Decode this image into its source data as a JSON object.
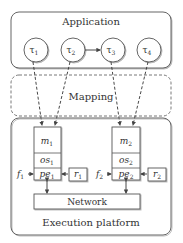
{
  "application": {
    "title": "Application",
    "tasks": [
      {
        "label": "τ",
        "sub": "1"
      },
      {
        "label": "τ",
        "sub": "2"
      },
      {
        "label": "τ",
        "sub": "3"
      },
      {
        "label": "τ",
        "sub": "4"
      }
    ]
  },
  "mapping": {
    "title": "Mapping"
  },
  "platform": {
    "title": "Execution platform",
    "nodes": [
      {
        "m": {
          "label": "m",
          "sub": "1"
        },
        "os": {
          "label": "os",
          "sub": "1"
        },
        "pe": {
          "label": "pe",
          "sub": "1"
        },
        "f": {
          "label": "f",
          "sub": "1"
        },
        "r": {
          "label": "r",
          "sub": "1"
        }
      },
      {
        "m": {
          "label": "m",
          "sub": "2"
        },
        "os": {
          "label": "os",
          "sub": "2"
        },
        "pe": {
          "label": "pe",
          "sub": "2"
        },
        "f": {
          "label": "f",
          "sub": "2"
        },
        "r": {
          "label": "r",
          "sub": "2"
        }
      }
    ],
    "network": "Network"
  },
  "colors": {
    "stroke": "#555555",
    "text": "#333333",
    "shadow": "#bbbbbb"
  }
}
